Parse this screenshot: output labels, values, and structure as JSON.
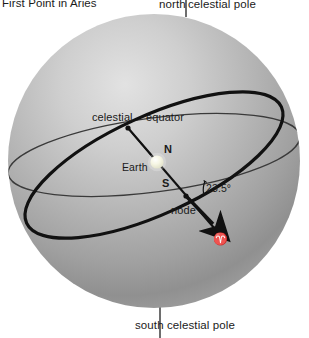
{
  "diagram": {
    "type": "astronomy-diagram",
    "background_color": "#ffffff",
    "sphere": {
      "fill_light": "#d8d8d8",
      "fill_mid": "#a8a8a8",
      "fill_dark": "#8a8a8a",
      "center_x": 154,
      "center_y": 161,
      "radius_x": 146,
      "radius_y": 147
    },
    "labels": {
      "first_point_aries": "First  Point  in  Aries",
      "ncp_north": "north",
      "ncp_rest": "celestial pole",
      "scp_south": "south",
      "scp_rest": "celestial pole",
      "celestial": "celestial",
      "equator": "equator",
      "earth": "Earth",
      "north_pole_letter": "N",
      "south_pole_letter": "S",
      "node": "node",
      "obliquity_angle": "23.5°",
      "aries_symbol": "♈"
    },
    "colors": {
      "equator_line": "#3a3a3a",
      "ecliptic_line": "#111111",
      "axis_line": "#111111",
      "pole_line": "#4a4a4a",
      "text": "#1a1a1a",
      "earth_body": "#fbfbe8"
    },
    "geometry": {
      "upper_node_x": 128,
      "upper_node_y": 128,
      "lower_node_x": 186,
      "lower_node_y": 196,
      "earth_x": 157,
      "earth_y": 162,
      "arrow_tip_x": 218,
      "arrow_tip_y": 228
    }
  }
}
